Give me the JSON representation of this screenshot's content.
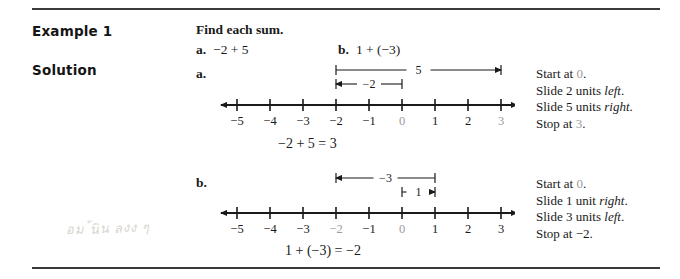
{
  "rules": {
    "top": "",
    "bottom": ""
  },
  "labels": {
    "example": "Example 1",
    "solution": "Solution"
  },
  "prompt": {
    "title": "Find each sum.",
    "problems": [
      {
        "tag": "a.",
        "expr": "−2 + 5"
      },
      {
        "tag": "b.",
        "expr": "1 + (−3)"
      }
    ]
  },
  "parts": [
    {
      "tag": "a.",
      "equation": "−2 + 5 = 3",
      "numberline": {
        "min": -5,
        "max": 3,
        "ticks": [
          -5,
          -4,
          -3,
          -2,
          -1,
          0,
          1,
          2,
          3
        ],
        "tick_labels": [
          "−5",
          "−4",
          "−3",
          "−2",
          "−1",
          "0",
          "1",
          "2",
          "3"
        ],
        "gray_labels": [
          "0",
          "3"
        ],
        "jumps": [
          {
            "label": "5",
            "from": -2,
            "to": 3,
            "direction": "right",
            "row": 0
          },
          {
            "label": "−2",
            "from": 0,
            "to": -2,
            "direction": "left",
            "row": 1
          }
        ]
      },
      "steps": [
        {
          "text": "Start at ",
          "value": "0",
          "value_gray": true,
          "tail": ".",
          "italic": ""
        },
        {
          "text": "Slide 2 units ",
          "italic": "left",
          "tail": "."
        },
        {
          "text": "Slide 5 units ",
          "italic": "right",
          "tail": "."
        },
        {
          "text": "Stop at ",
          "value": "3",
          "value_gray": true,
          "tail": ".",
          "italic": ""
        }
      ]
    },
    {
      "tag": "b.",
      "equation": "1 + (−3) = −2",
      "numberline": {
        "min": -5,
        "max": 3,
        "ticks": [
          -5,
          -4,
          -3,
          -2,
          -1,
          0,
          1,
          2,
          3
        ],
        "tick_labels": [
          "−5",
          "−4",
          "−3",
          "−2",
          "−1",
          "0",
          "1",
          "2",
          "3"
        ],
        "gray_labels": [
          "−2",
          "0"
        ],
        "jumps": [
          {
            "label": "−3",
            "from": 1,
            "to": -2,
            "direction": "left",
            "row": 0
          },
          {
            "label": "1",
            "from": 0,
            "to": 1,
            "direction": "right",
            "row": 1
          }
        ]
      },
      "steps": [
        {
          "text": "Start at ",
          "value": "0",
          "value_gray": true,
          "tail": ".",
          "italic": ""
        },
        {
          "text": "Slide 1 unit ",
          "italic": "right",
          "tail": "."
        },
        {
          "text": "Slide 3 units ",
          "italic": "left",
          "tail": "."
        },
        {
          "text": "Stop at ",
          "value": "−2",
          "value_gray": false,
          "tail": ".",
          "italic": ""
        }
      ]
    }
  ],
  "annotation": {
    "pencil_scribble": "อม ้นิน ลงง ๆ"
  },
  "colors": {
    "ink": "#1a1a1a",
    "rule": "#3a3a3a",
    "gray_text": "#9b9b9b",
    "pencil": "#d8d6cf"
  }
}
